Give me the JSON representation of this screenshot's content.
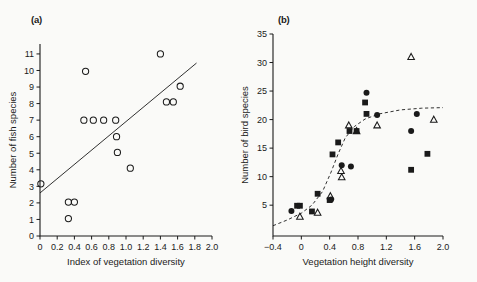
{
  "figure": {
    "background_color": "#fafaf8",
    "ink_color": "#1a1a1a"
  },
  "panels": [
    {
      "id": "a",
      "label": "(a)"
    },
    {
      "id": "b",
      "label": "(b)"
    }
  ],
  "chart_data": [
    {
      "type": "scatter",
      "panel": "(a)",
      "title": "",
      "xlabel": "Index of vegetation diversity",
      "ylabel": "Number of fish species",
      "xlim": [
        0,
        2.0
      ],
      "ylim": [
        0,
        11.6
      ],
      "grid": false,
      "legend": null,
      "xticks": [
        0,
        0.2,
        0.4,
        0.6,
        0.8,
        1.0,
        1.2,
        1.4,
        1.6,
        1.8,
        2.0
      ],
      "xticklabels": [
        "0",
        "0.2",
        "0.4",
        "0.6",
        "0.8",
        "1.0",
        "1.2",
        "1.4",
        "1.6",
        "1.8",
        "2.0"
      ],
      "yticks": [
        0,
        1,
        2,
        3,
        4,
        5,
        6,
        7,
        8,
        9,
        10,
        11
      ],
      "yticklabels": [
        "0",
        "1",
        "2",
        "3",
        "4",
        "5",
        "6",
        "7",
        "8",
        "9",
        "10",
        "11"
      ],
      "marker": "open-circle",
      "points": [
        {
          "x": 0.01,
          "y": 3.15
        },
        {
          "x": 0.33,
          "y": 2.05
        },
        {
          "x": 0.33,
          "y": 1.05
        },
        {
          "x": 0.4,
          "y": 2.05
        },
        {
          "x": 0.51,
          "y": 7.0
        },
        {
          "x": 0.53,
          "y": 9.95
        },
        {
          "x": 0.62,
          "y": 7.0
        },
        {
          "x": 0.74,
          "y": 7.0
        },
        {
          "x": 0.88,
          "y": 7.0
        },
        {
          "x": 0.89,
          "y": 6.0
        },
        {
          "x": 0.9,
          "y": 5.05
        },
        {
          "x": 1.05,
          "y": 4.1
        },
        {
          "x": 1.4,
          "y": 11.0
        },
        {
          "x": 1.47,
          "y": 8.1
        },
        {
          "x": 1.55,
          "y": 8.1
        },
        {
          "x": 1.63,
          "y": 9.05
        }
      ],
      "fit": {
        "style": "solid-straight-line",
        "x_start": 0.0,
        "y_start": 2.6,
        "x_end": 1.82,
        "y_end": 10.45
      }
    },
    {
      "type": "scatter",
      "panel": "(b)",
      "title": "",
      "xlabel": "Vegetation height diversity",
      "ylabel": "Number of bird species",
      "xlim": [
        -0.4,
        2.0
      ],
      "ylim": [
        -0.4,
        35
      ],
      "grid": false,
      "legend": null,
      "xticks": [
        -0.4,
        0,
        0.4,
        0.8,
        1.2,
        1.6,
        2.0
      ],
      "xticklabels": [
        "−0.4",
        "0",
        "0.4",
        "0.8",
        "1.2",
        "1.6",
        "2.0"
      ],
      "yticks": [
        5,
        10,
        15,
        20,
        25,
        30,
        35
      ],
      "yticklabels": [
        "5",
        "10",
        "15",
        "20",
        "25",
        "30",
        "35"
      ],
      "series": [
        {
          "name": "filled-circle",
          "marker": "filled-circle",
          "points": [
            {
              "x": -0.14,
              "y": 4.0
            },
            {
              "x": 0.42,
              "y": 6.0
            },
            {
              "x": 0.57,
              "y": 12.0
            },
            {
              "x": 0.7,
              "y": 11.8
            },
            {
              "x": 0.92,
              "y": 24.7
            },
            {
              "x": 1.07,
              "y": 20.8
            },
            {
              "x": 1.55,
              "y": 18.0
            },
            {
              "x": 1.63,
              "y": 21.0
            }
          ]
        },
        {
          "name": "filled-square",
          "marker": "filled-square",
          "points": [
            {
              "x": -0.06,
              "y": 4.9
            },
            {
              "x": -0.02,
              "y": 4.9
            },
            {
              "x": 0.15,
              "y": 3.9
            },
            {
              "x": 0.23,
              "y": 7.0
            },
            {
              "x": 0.4,
              "y": 5.9
            },
            {
              "x": 0.44,
              "y": 13.9
            },
            {
              "x": 0.52,
              "y": 16.0
            },
            {
              "x": 0.68,
              "y": 18.0
            },
            {
              "x": 0.78,
              "y": 18.0
            },
            {
              "x": 0.9,
              "y": 23.0
            },
            {
              "x": 0.92,
              "y": 21.0
            },
            {
              "x": 1.55,
              "y": 11.2
            },
            {
              "x": 1.78,
              "y": 14.0
            }
          ]
        },
        {
          "name": "open-triangle",
          "marker": "open-triangle",
          "points": [
            {
              "x": -0.02,
              "y": 3.0
            },
            {
              "x": 0.23,
              "y": 3.7
            },
            {
              "x": 0.41,
              "y": 6.6
            },
            {
              "x": 0.56,
              "y": 11.0
            },
            {
              "x": 0.57,
              "y": 9.9
            },
            {
              "x": 0.67,
              "y": 19.0
            },
            {
              "x": 0.78,
              "y": 18.0
            },
            {
              "x": 1.07,
              "y": 19.0
            },
            {
              "x": 1.55,
              "y": 31.0
            },
            {
              "x": 1.87,
              "y": 20.0
            }
          ]
        }
      ],
      "fit": {
        "style": "dashed-sigmoid-curve",
        "description": "dashed curve rising steeply between x=0.2 and x=0.8 then levelling near y=22",
        "points": [
          {
            "x": -0.4,
            "y": 1.4
          },
          {
            "x": -0.2,
            "y": 2.4
          },
          {
            "x": 0.0,
            "y": 3.6
          },
          {
            "x": 0.15,
            "y": 5.0
          },
          {
            "x": 0.3,
            "y": 7.4
          },
          {
            "x": 0.42,
            "y": 10.8
          },
          {
            "x": 0.52,
            "y": 14.0
          },
          {
            "x": 0.62,
            "y": 16.8
          },
          {
            "x": 0.75,
            "y": 18.8
          },
          {
            "x": 0.9,
            "y": 20.1
          },
          {
            "x": 1.1,
            "y": 21.0
          },
          {
            "x": 1.4,
            "y": 21.7
          },
          {
            "x": 1.7,
            "y": 22.0
          },
          {
            "x": 2.0,
            "y": 22.1
          }
        ]
      }
    }
  ]
}
